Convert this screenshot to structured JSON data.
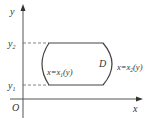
{
  "diagram": {
    "axes": {
      "x_label": "x",
      "y_label": "y",
      "origin_label": "O"
    },
    "y_ticks": {
      "upper": {
        "base": "y",
        "sub": "2"
      },
      "lower": {
        "base": "y",
        "sub": "1"
      }
    },
    "region": {
      "label": "D",
      "left_boundary": {
        "pre": "x=x",
        "sub": "1",
        "post": "(y)"
      },
      "right_boundary": {
        "pre": "x=x",
        "sub": "2",
        "post": "(y)"
      }
    },
    "colors": {
      "stroke": "#444444",
      "axis": "#555555",
      "dash": "#666666",
      "text": "#333333"
    }
  }
}
